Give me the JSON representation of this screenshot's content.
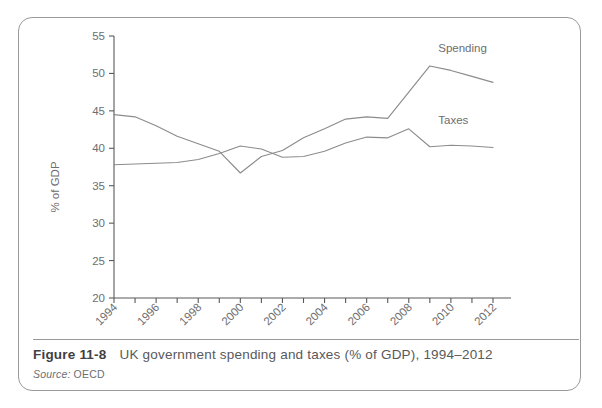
{
  "figure": {
    "number": "Figure 11-8",
    "caption": "UK government spending and taxes (% of GDP), 1994–2012",
    "source_label": "Source:",
    "source_value": "OECD"
  },
  "chart_data": {
    "type": "line",
    "title": "",
    "xlabel": "",
    "ylabel": "% of GDP",
    "xlim": [
      1994,
      2012
    ],
    "ylim": [
      20,
      55
    ],
    "yticks": [
      20,
      25,
      30,
      35,
      40,
      45,
      50,
      55
    ],
    "ytick_labels": [
      "20",
      "25",
      "30",
      "35",
      "40",
      "45",
      "50",
      "55"
    ],
    "x": [
      1994,
      1995,
      1996,
      1997,
      1998,
      1999,
      2000,
      2001,
      2002,
      2003,
      2004,
      2005,
      2006,
      2007,
      2008,
      2009,
      2010,
      2011,
      2012
    ],
    "xticks": [
      1994,
      1995,
      1996,
      1997,
      1998,
      1999,
      2000,
      2001,
      2002,
      2003,
      2004,
      2005,
      2006,
      2007,
      2008,
      2009,
      2010,
      2011,
      2012
    ],
    "xtick_labels": [
      "1994",
      "",
      "1996",
      "",
      "1998",
      "",
      "2000",
      "",
      "2002",
      "",
      "2004",
      "",
      "2006",
      "",
      "2008",
      "",
      "2010",
      "",
      "2012"
    ],
    "grid": false,
    "legend_position": "inline-right",
    "series": [
      {
        "name": "Spending",
        "color": "#8c8c8c",
        "values": [
          44.5,
          44.2,
          43.0,
          41.6,
          40.6,
          39.6,
          36.7,
          38.9,
          39.7,
          41.4,
          42.6,
          43.9,
          44.2,
          44.0,
          47.5,
          51.0,
          50.4,
          49.6,
          48.8
        ]
      },
      {
        "name": "Taxes",
        "color": "#8c8c8c",
        "values": [
          37.8,
          37.9,
          38.0,
          38.1,
          38.5,
          39.3,
          40.3,
          39.9,
          38.8,
          38.9,
          39.6,
          40.7,
          41.5,
          41.4,
          42.6,
          40.2,
          40.4,
          40.3,
          40.1
        ]
      }
    ],
    "annotations": [
      {
        "text": "Spending",
        "x": 2009.4,
        "y": 52.9
      },
      {
        "text": "Taxes",
        "x": 2009.4,
        "y": 43.3
      }
    ]
  }
}
